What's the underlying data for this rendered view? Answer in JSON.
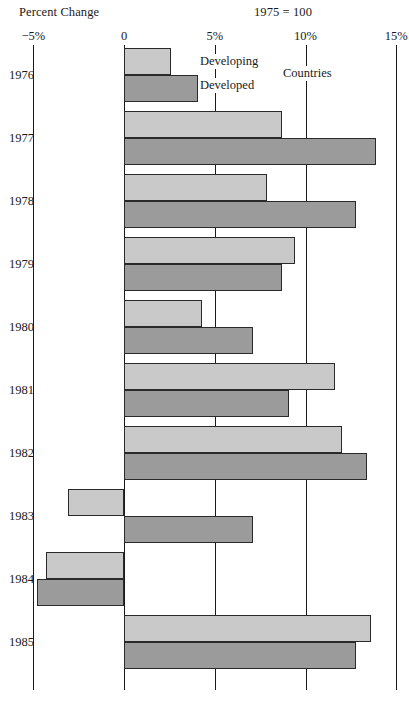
{
  "header": {
    "left_title": "Percent Change",
    "right_title": "1975  =  100"
  },
  "legend": {
    "developing": "Developing",
    "developed": "Developed",
    "countries": "Countries"
  },
  "colors": {
    "developing": "#c9c9c9",
    "developed": "#9b9b9b",
    "axis": "#1a1a1a",
    "background": "#ffffff",
    "bar_border": "#2a2a2a"
  },
  "chart_data": {
    "type": "bar",
    "orientation": "horizontal",
    "title": "Percent Change",
    "subtitle": "1975  =  100",
    "xlabel": "Percent Change",
    "ylabel": "",
    "xlim": [
      -5,
      15
    ],
    "grid": true,
    "gridlines_at": [
      -5,
      0,
      5,
      10,
      15
    ],
    "legend_position": "inline-top",
    "tick_labels": [
      "−5%",
      "0",
      "5%",
      "10%",
      "15%"
    ],
    "tick_values": [
      -5,
      0,
      5,
      10,
      15
    ],
    "categories": [
      "1976",
      "1977",
      "1978",
      "1979",
      "1980",
      "1981",
      "1982",
      "1983",
      "1984",
      "1985"
    ],
    "series": [
      {
        "name": "Developing",
        "color": "#c9c9c9",
        "values": [
          2.6,
          8.7,
          7.9,
          9.4,
          4.3,
          11.6,
          12.0,
          -3.1,
          -4.3,
          13.6
        ]
      },
      {
        "name": "Developed",
        "color": "#9b9b9b",
        "values": [
          4.1,
          13.9,
          12.8,
          8.7,
          7.1,
          9.1,
          13.4,
          7.1,
          -4.8,
          12.8
        ]
      }
    ]
  }
}
